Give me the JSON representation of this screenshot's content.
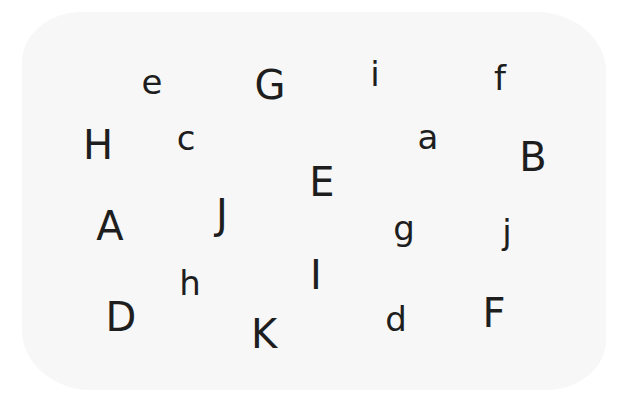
{
  "letters": [
    {
      "char": "e",
      "x": 152,
      "y": 82
    },
    {
      "char": "G",
      "x": 270,
      "y": 85
    },
    {
      "char": "i",
      "x": 375,
      "y": 74
    },
    {
      "char": "f",
      "x": 500,
      "y": 78
    },
    {
      "char": "H",
      "x": 98,
      "y": 145
    },
    {
      "char": "c",
      "x": 186,
      "y": 138
    },
    {
      "char": "a",
      "x": 428,
      "y": 137
    },
    {
      "char": "B",
      "x": 533,
      "y": 157
    },
    {
      "char": "E",
      "x": 322,
      "y": 182
    },
    {
      "char": "A",
      "x": 110,
      "y": 226
    },
    {
      "char": "J",
      "x": 222,
      "y": 214
    },
    {
      "char": "g",
      "x": 404,
      "y": 228
    },
    {
      "char": "j",
      "x": 507,
      "y": 232
    },
    {
      "char": "h",
      "x": 190,
      "y": 283
    },
    {
      "char": "I",
      "x": 316,
      "y": 275
    },
    {
      "char": "D",
      "x": 121,
      "y": 317
    },
    {
      "char": "K",
      "x": 264,
      "y": 334
    },
    {
      "char": "d",
      "x": 396,
      "y": 319
    },
    {
      "char": "F",
      "x": 494,
      "y": 313
    }
  ]
}
